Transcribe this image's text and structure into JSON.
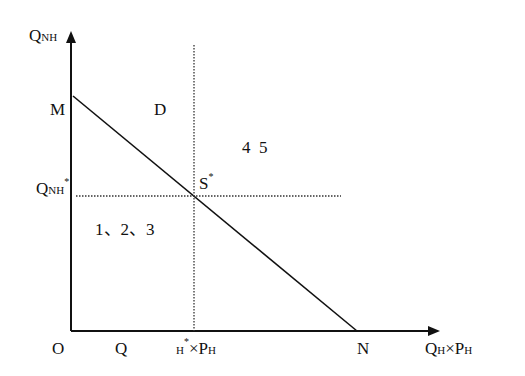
{
  "diagram": {
    "y_axis_label": {
      "main": "Q",
      "sub": "NH"
    },
    "x_axis_label": {
      "main": "Q",
      "sub": "H",
      "rest": "×P",
      "rest_sub": "H"
    },
    "origin_label": "O",
    "point_m": "M",
    "point_n": "N",
    "point_d": "D",
    "equilibrium": {
      "main": "S",
      "sup": "*"
    },
    "q_nh_star": {
      "main": "Q",
      "sub": "NH",
      "sup": "*"
    },
    "x_star_label": {
      "q": "Q",
      "h_sub": "H",
      "sup": "*",
      "rest": "×P",
      "rest_sub": "H"
    },
    "region_left_label": "1、2、3",
    "region_right_label": "4  5"
  }
}
